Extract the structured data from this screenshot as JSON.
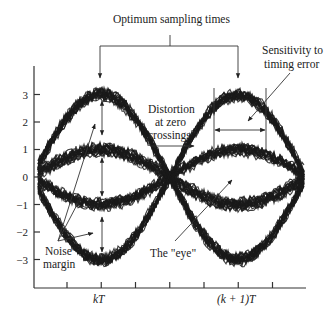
{
  "chart_data": {
    "type": "line",
    "title": "",
    "xlabel": "",
    "ylabel": "",
    "x_tick_labels": [
      {
        "pos": "kT",
        "label": "kT"
      },
      {
        "pos": "(k+1)T",
        "label": "(k + 1)T"
      }
    ],
    "x_tick_count": 7,
    "y_ticks": [
      3,
      2,
      1,
      0,
      -1,
      -2,
      -3
    ],
    "y_tick_labels": [
      "3",
      "2",
      "1",
      "0",
      "−1",
      "−2",
      "−3"
    ],
    "ylim": [
      -4,
      4
    ],
    "levels": [
      3,
      1,
      -1,
      -3
    ],
    "grid": false,
    "series": [
      {
        "name": "transitions +3 → −3",
        "from": 3,
        "to": -3
      },
      {
        "name": "transitions −3 → +3",
        "from": -3,
        "to": 3
      },
      {
        "name": "transitions +1 → −1",
        "from": 1,
        "to": -1
      },
      {
        "name": "transitions −1 → +1",
        "from": -1,
        "to": 1
      }
    ],
    "annotations": [
      {
        "text": "Optimum sampling times",
        "points_to": [
          "kT",
          "(k+1)T"
        ]
      },
      {
        "text": "Sensitivity to timing error",
        "points_to": "eye width around (k+1)T upper eye"
      },
      {
        "text": "Distortion at zero crossings",
        "points_to": "spread of crossings at midpoint"
      },
      {
        "text": "Noise margin",
        "points_to": "vertical eye openings at kT"
      },
      {
        "text": "The \"eye\"",
        "points_to": "eye opening near (k+1)T"
      }
    ]
  },
  "labels": {
    "optimum": "Optimum sampling times",
    "sensitivity_1": "Sensitivity to",
    "sensitivity_2": "timing error",
    "distortion_1": "Distortion",
    "distortion_2": "at zero",
    "distortion_3": "crossings",
    "noise_1": "Noise",
    "noise_2": "margin",
    "eye": "The \"eye\"",
    "kT": "kT",
    "k1T": "(k + 1)T"
  },
  "colors": {
    "trace": "#1a1a1a",
    "axis": "#333333",
    "background": "#ffffff"
  }
}
